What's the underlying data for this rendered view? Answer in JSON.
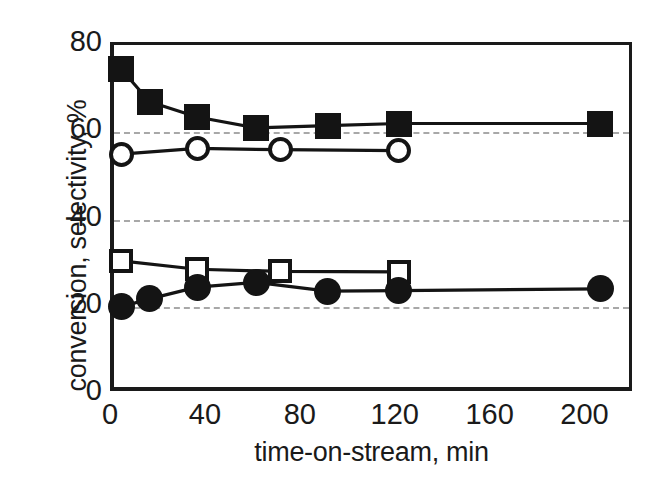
{
  "chart_data": {
    "type": "line",
    "title": "",
    "subtitle": "",
    "xlabel": "time-on-stream, min",
    "ylabel": "conversion, selectivity, %",
    "xlim": [
      0,
      220
    ],
    "ylim": [
      0,
      80
    ],
    "xticks": [
      0,
      40,
      80,
      120,
      160,
      200
    ],
    "xtick_labels": [
      "0",
      "40",
      "80",
      "120",
      "160",
      "200"
    ],
    "yticks": [
      0,
      20,
      40,
      60,
      80
    ],
    "ytick_labels": [
      "0",
      "20",
      "40",
      "60",
      "80"
    ],
    "grid": "horizontal dashed gridlines at 20, 40, 60",
    "gridlines_y": [
      20,
      40,
      60
    ],
    "legend": "none",
    "series": [
      {
        "name": "selectivity (filled squares)",
        "marker": "filled-square",
        "x": [
          3,
          15,
          35,
          60,
          90,
          120,
          205
        ],
        "y": [
          74.5,
          67.0,
          63.5,
          61.0,
          61.5,
          62.0,
          62.0
        ]
      },
      {
        "name": "selectivity (open circles)",
        "marker": "open-circle",
        "x": [
          3,
          35,
          70,
          120
        ],
        "y": [
          55.0,
          56.3,
          56.0,
          55.8
        ]
      },
      {
        "name": "conversion (open squares)",
        "marker": "open-square",
        "x": [
          3,
          35,
          70,
          120
        ],
        "y": [
          30.5,
          28.6,
          28.1,
          28.0
        ]
      },
      {
        "name": "conversion (filled circles)",
        "marker": "filled-circle",
        "x": [
          3,
          15,
          35,
          60,
          90,
          120,
          205
        ],
        "y": [
          20.0,
          21.8,
          24.5,
          25.6,
          23.6,
          23.7,
          24.1
        ]
      }
    ]
  },
  "style": {
    "ink": "#141414",
    "grid_color": "#a8a8a8",
    "background": "#ffffff"
  }
}
